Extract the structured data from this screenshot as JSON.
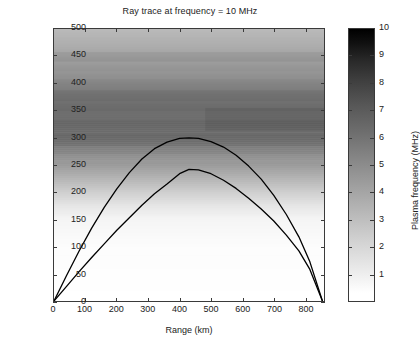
{
  "figure": {
    "title": "Ray trace at frequency = 10 MHz"
  },
  "axes": {
    "xlabel": "Range (km)",
    "ylabel": "Height (km)",
    "xticks": [
      "0",
      "100",
      "200",
      "300",
      "400",
      "500",
      "600",
      "700",
      "800"
    ],
    "yticks": [
      "0",
      "50",
      "100",
      "150",
      "200",
      "250",
      "300",
      "350",
      "400",
      "450",
      "500"
    ]
  },
  "colorbar": {
    "label": "Plasma frequency (MHz)",
    "ticks": [
      "1",
      "2",
      "3",
      "4",
      "5",
      "6",
      "7",
      "8",
      "9",
      "10"
    ]
  },
  "chart_data": {
    "type": "line",
    "title": "Ray trace at frequency = 10 MHz",
    "xlabel": "Range (km)",
    "ylabel": "Height (km)",
    "xlim": [
      0,
      860
    ],
    "ylim": [
      0,
      500
    ],
    "grid": false,
    "legend": "none",
    "background_field": {
      "type": "heatmap",
      "description": "Ionospheric plasma frequency profile varying with height",
      "colormap": "gray_reversed",
      "value_label": "Plasma frequency (MHz)",
      "vmin": 0,
      "vmax": 10,
      "height_km": [
        0,
        100,
        150,
        175,
        200,
        225,
        250,
        275,
        300,
        325,
        350,
        375,
        400,
        425,
        450,
        475,
        500
      ],
      "plasma_freq_mhz": [
        0.0,
        0.1,
        0.4,
        1.0,
        1.9,
        2.9,
        3.9,
        4.8,
        5.6,
        6.0,
        5.9,
        5.4,
        4.8,
        4.2,
        3.6,
        3.1,
        2.7
      ]
    },
    "series": [
      {
        "name": "Upper ray",
        "apex_range_km": 430,
        "apex_height_km": 300,
        "ground_range_km": 855,
        "x": [
          0,
          40,
          80,
          120,
          160,
          200,
          240,
          280,
          320,
          360,
          400,
          430,
          460,
          500,
          540,
          580,
          620,
          660,
          700,
          740,
          780,
          815,
          855
        ],
        "y": [
          0,
          47,
          92,
          134,
          172,
          206,
          236,
          261,
          280,
          292,
          299,
          300,
          299,
          293,
          283,
          268,
          248,
          224,
          194,
          159,
          118,
          72,
          0
        ]
      },
      {
        "name": "Lower ray",
        "apex_range_km": 430,
        "apex_height_km": 243,
        "ground_range_km": 855,
        "x": [
          0,
          40,
          80,
          120,
          160,
          200,
          240,
          280,
          320,
          360,
          400,
          430,
          460,
          500,
          540,
          580,
          620,
          660,
          700,
          740,
          780,
          815,
          855
        ],
        "y": [
          0,
          27,
          54,
          80,
          105,
          130,
          153,
          176,
          197,
          215,
          234,
          242,
          241,
          234,
          222,
          207,
          189,
          169,
          147,
          121,
          92,
          58,
          0
        ]
      }
    ]
  }
}
